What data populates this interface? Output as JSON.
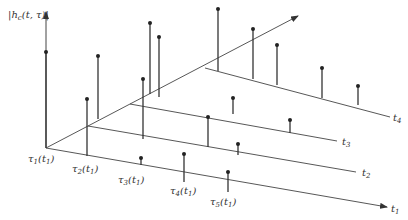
{
  "diagram": {
    "type": "3d-stem-plot",
    "colors": {
      "line": "#444444",
      "stem": "#333333",
      "dot": "#222222",
      "text": "#333333",
      "background": "#ffffff"
    },
    "vertical_axis": {
      "label": "|h_c(t, τ)|",
      "label_main": "|h",
      "label_sub": "c",
      "label_rest": "(t, τ)|"
    },
    "time_axes": [
      {
        "id": "t1",
        "label": "t",
        "sub": "1"
      },
      {
        "id": "t2",
        "label": "t",
        "sub": "2"
      },
      {
        "id": "t3",
        "label": "t",
        "sub": "3"
      },
      {
        "id": "t4",
        "label": "t",
        "sub": "4"
      }
    ],
    "delay_labels": [
      {
        "label": "τ",
        "sub": "1",
        "arg": "(t",
        "argsub": "1",
        "close": ")"
      },
      {
        "label": "τ",
        "sub": "2",
        "arg": "(t",
        "argsub": "1",
        "close": ")"
      },
      {
        "label": "τ",
        "sub": "3",
        "arg": "(t",
        "argsub": "1",
        "close": ")"
      },
      {
        "label": "τ",
        "sub": "4",
        "arg": "(t",
        "argsub": "1",
        "close": ")"
      },
      {
        "label": "τ",
        "sub": "5",
        "arg": "(t",
        "argsub": "1",
        "close": ")"
      }
    ],
    "stems": {
      "t1": [
        {
          "tau": 1,
          "x": 46,
          "top": 52,
          "base": 148
        },
        {
          "tau": 2,
          "x": 87,
          "top": 99,
          "base": 156
        },
        {
          "tau": 3,
          "x": 141,
          "top": 158,
          "base": 165
        },
        {
          "tau": 4,
          "x": 184,
          "top": 154,
          "base": 182
        },
        {
          "tau": 5,
          "x": 228,
          "top": 172,
          "base": 192
        }
      ],
      "t2": [
        {
          "tau": 1,
          "x": 98,
          "top": 56,
          "base": 119
        },
        {
          "tau": 2,
          "x": 143,
          "top": 79,
          "base": 139
        },
        {
          "tau": 3,
          "x": 208,
          "top": 117,
          "base": 147
        },
        {
          "tau": 4,
          "x": 238,
          "top": 144,
          "base": 155
        }
      ],
      "t3": [
        {
          "tau": 1,
          "x": 150,
          "top": 23,
          "base": 94
        },
        {
          "tau": 2,
          "x": 159,
          "top": 37,
          "base": 97
        },
        {
          "tau": 3,
          "x": 233,
          "top": 98,
          "base": 114
        },
        {
          "tau": 4,
          "x": 290,
          "top": 120,
          "base": 133
        }
      ],
      "t4": [
        {
          "tau": 1,
          "x": 218,
          "top": 9,
          "base": 71
        },
        {
          "tau": 2,
          "x": 253,
          "top": 29,
          "base": 79
        },
        {
          "tau": 3,
          "x": 277,
          "top": 45,
          "base": 85
        },
        {
          "tau": 4,
          "x": 322,
          "top": 68,
          "base": 98
        },
        {
          "tau": 5,
          "x": 358,
          "top": 86,
          "base": 105
        }
      ]
    }
  }
}
